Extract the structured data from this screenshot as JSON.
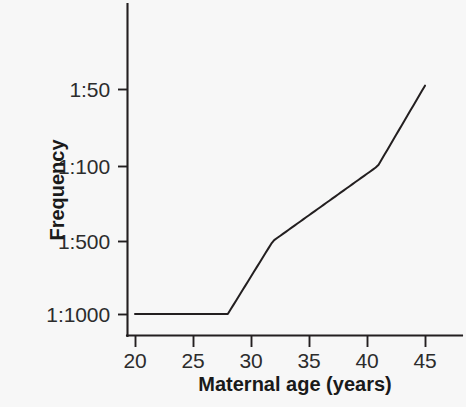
{
  "chart_data": {
    "type": "line",
    "title": "",
    "subtitle": "",
    "xlabel": "Maternal age (years)",
    "ylabel": "Frequency",
    "grid": false,
    "legend": false,
    "legend_position": "none",
    "line_color": "#231f20",
    "background_color": "#f7f7f7",
    "xlim": [
      20,
      46.5
    ],
    "ylim_labels_top_to_bottom": [
      "1:50",
      "1:100",
      "1:500",
      "1:1000"
    ],
    "x_ticks": [
      20,
      25,
      30,
      35,
      40,
      45
    ],
    "x_tick_labels": [
      "20",
      "25",
      "30",
      "35",
      "40",
      "45"
    ],
    "y_ticks": [
      "1:50",
      "1:100",
      "1:500",
      "1:1000"
    ],
    "y_tick_labels": [
      "1:50",
      "1:100",
      "1:500",
      "1:1000"
    ],
    "series": [
      {
        "name": "Down syndrome frequency by maternal age",
        "x": [
          20,
          22,
          24,
          26,
          28,
          29,
          30,
          31,
          32,
          33,
          34,
          35,
          36,
          37,
          38,
          39,
          40,
          41,
          42,
          43,
          44,
          45
        ],
        "y_labels": [
          "1:1000",
          "1:1000",
          "1:1000",
          "1:1000",
          "1:1000",
          "1:980",
          "1:940",
          "1:890",
          "1:830",
          "1:760",
          "1:680",
          "1:600",
          "1:520",
          "1:440",
          "1:370",
          "1:300",
          "1:240",
          "1:180",
          "1:140",
          "1:105",
          "1:75",
          "1:50"
        ],
        "points_px": [
          [
            135,
            313
          ],
          [
            146,
            313
          ],
          [
            158,
            313
          ],
          [
            170,
            313
          ],
          [
            181,
            312
          ],
          [
            187,
            310
          ],
          [
            193,
            307
          ],
          [
            199,
            303
          ],
          [
            205,
            298
          ],
          [
            211,
            292
          ],
          [
            216,
            285
          ],
          [
            222,
            277
          ],
          [
            228,
            268
          ],
          [
            234,
            258
          ],
          [
            240,
            247
          ],
          [
            245,
            234
          ],
          [
            251,
            221
          ],
          [
            257,
            206
          ],
          [
            263,
            190
          ],
          [
            269,
            173
          ],
          [
            274,
            155
          ],
          [
            280,
            136
          ]
        ]
      }
    ],
    "annotations": []
  },
  "axes": {
    "y_axis_title": "Frequency",
    "x_axis_title": "Maternal age (years)",
    "y_tick_labels": [
      {
        "text": "1:50",
        "px_y": 89
      },
      {
        "text": "1:100",
        "px_y": 166
      },
      {
        "text": "1:500",
        "px_y": 241
      },
      {
        "text": "1:1000",
        "px_y": 314
      }
    ],
    "x_tick_labels": [
      {
        "text": "20",
        "px_x": 135
      },
      {
        "text": "25",
        "px_x": 193
      },
      {
        "text": "30",
        "px_x": 251
      },
      {
        "text": "35",
        "px_x": 309
      },
      {
        "text": "40",
        "px_x": 367
      },
      {
        "text": "45",
        "px_x": 425
      }
    ]
  }
}
